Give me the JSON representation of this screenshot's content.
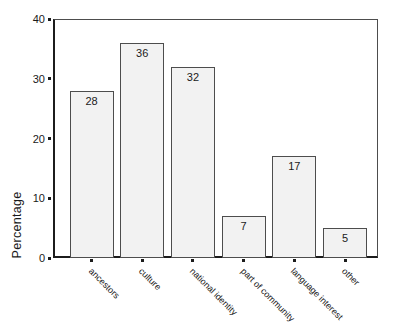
{
  "chart_data": {
    "type": "bar",
    "categories": [
      "ancestors",
      "culture",
      "national identity",
      "part of community",
      "language interest",
      "other"
    ],
    "values": [
      28,
      36,
      32,
      7,
      17,
      5
    ],
    "title": "",
    "xlabel": "",
    "ylabel": "Percentage",
    "ylim": [
      0,
      40
    ],
    "yticks": [
      0,
      10,
      20,
      30,
      40
    ],
    "grid": false,
    "legend": false,
    "value_labels_shown": true,
    "bar_fill": "#f2f2f2",
    "bar_border": "#4d4d4d",
    "axis_color": "#1c1c1c",
    "frame_light_color": "#4d4d4d",
    "text_color": "#1a1a1a",
    "background": "#ffffff"
  }
}
